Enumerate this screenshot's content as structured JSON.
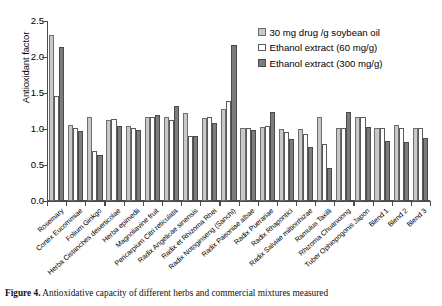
{
  "chart_data": {
    "type": "bar",
    "title": "",
    "xlabel": "",
    "ylabel": "Antioxidant factor",
    "ylim": [
      0.0,
      2.5
    ],
    "ytick_labels": [
      "0.0",
      "0.5",
      "1.0",
      "1.5",
      "2.0",
      "2.5"
    ],
    "ytick_values": [
      0.0,
      0.5,
      1.0,
      1.5,
      2.0,
      2.5
    ],
    "grid": false,
    "legend_position": "top-right",
    "categories": [
      "Rosemary",
      "Cortex Eucommiae",
      "Folium Ginkgo",
      "Herba Cistanches deserticolae",
      "Herba epimedii",
      "Magnoliavine fruit",
      "Pericarpium Citri reticulata",
      "Radix Angelicae sinensis",
      "Radix et Rhizoma Rhei",
      "Radix Notoginseng (Sanchi)",
      "Radix Paeoniae albae",
      "Radix Puerariae",
      "Radix Rhapontici",
      "Radix Salviae miltiorrhizae",
      "Ramulus Taxilli",
      "Rhizoma Chuanxiong",
      "Tuber Ophiopogonis Japon",
      "Blend 1",
      "Blend 2",
      "Blend 3"
    ],
    "series": [
      {
        "name": "30 mg drug /g soybean oil",
        "color": "#c8c8c8",
        "values": [
          2.3,
          1.06,
          1.17,
          1.13,
          1.04,
          1.17,
          1.16,
          1.22,
          1.15,
          1.28,
          1.01,
          1.03,
          1.0,
          1.0,
          1.17,
          1.01,
          1.16,
          1.01,
          1.06,
          1.01
        ]
      },
      {
        "name": "Ethanol extract (60 mg/g)",
        "color": "#ffffff",
        "values": [
          1.46,
          1.02,
          0.69,
          1.14,
          1.01,
          1.16,
          1.13,
          0.9,
          1.17,
          1.39,
          1.01,
          1.04,
          0.96,
          0.93,
          0.79,
          1.02,
          1.17,
          1.02,
          1.01,
          1.02
        ]
      },
      {
        "name": "Ethanol extract (300 mg/g)",
        "color": "#7c7c7c",
        "values": [
          2.14,
          0.97,
          0.64,
          1.04,
          0.99,
          1.19,
          1.32,
          0.9,
          1.08,
          2.17,
          0.99,
          1.24,
          0.86,
          0.75,
          0.46,
          1.24,
          1.03,
          0.84,
          0.82,
          0.88
        ]
      }
    ]
  },
  "legend": {
    "items": [
      {
        "label": "30 mg drug /g soybean oil"
      },
      {
        "label": "Ethanol extract (60 mg/g)"
      },
      {
        "label": "Ethanol extract (300 mg/g)"
      }
    ]
  },
  "caption": {
    "label": "Figure 4.",
    "text": " Antioxidative capacity of different herbs and commercial mixtures measured"
  }
}
